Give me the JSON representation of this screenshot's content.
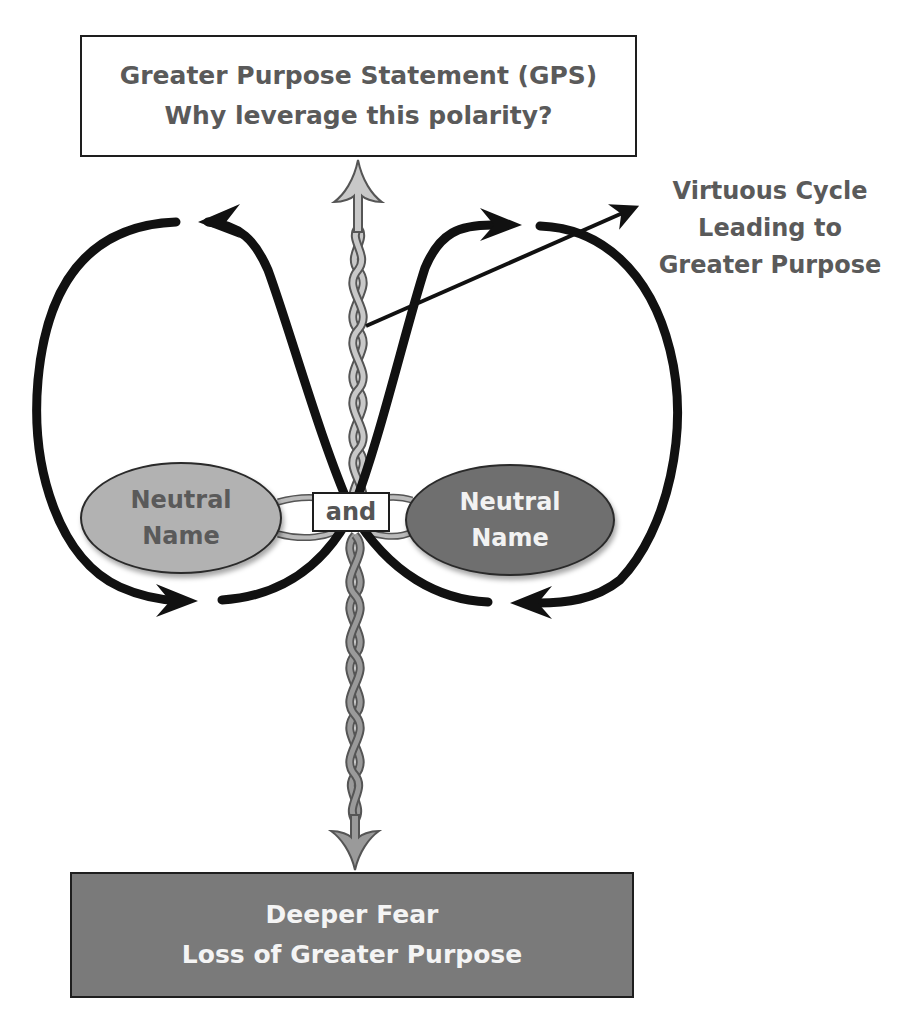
{
  "diagram": {
    "type": "polarity-map",
    "top_box": {
      "line1": "Greater Purpose Statement (GPS)",
      "line2": "Why leverage this polarity?",
      "fill": "#ffffff",
      "text_color": "#5a5a5a"
    },
    "bottom_box": {
      "line1": "Deeper Fear",
      "line2": "Loss of Greater Purpose",
      "fill": "#7a7a7a",
      "text_color": "#f4f4f4"
    },
    "left_pole": {
      "line1": "Neutral",
      "line2": "Name",
      "fill": "#b2b2b2",
      "text_color": "#5a5a5a"
    },
    "right_pole": {
      "line1": "Neutral",
      "line2": "Name",
      "fill": "#6f6f6f",
      "text_color": "#f2f2f2"
    },
    "connector": {
      "label": "and"
    },
    "annotation": {
      "line1": "Virtuous Cycle",
      "line2": "Leading to",
      "line3": "Greater Purpose"
    },
    "icons": {
      "upward_braid_arrow": "braided-arrow-up",
      "downward_braid_arrow": "braided-arrow-down",
      "left_loop": "infinity-loop-left",
      "right_loop": "infinity-loop-right",
      "pointer": "pointer-arrow"
    },
    "colors": {
      "loop_stroke": "#111111",
      "braid_up": "#c8c8c8",
      "braid_down": "#9a9a9a",
      "braid_outline": "#555555"
    }
  }
}
